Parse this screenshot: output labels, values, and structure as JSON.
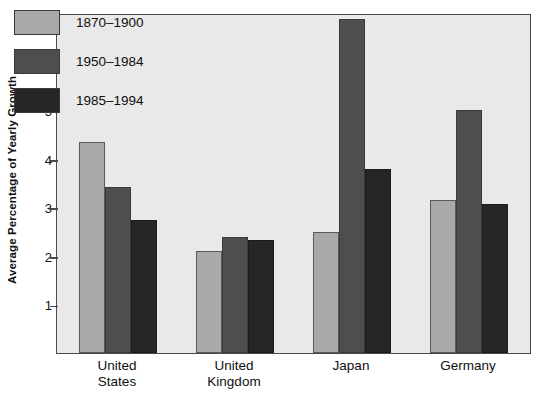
{
  "chart_data": {
    "type": "bar",
    "title": "",
    "xlabel": "",
    "ylabel": "Average Percentage of Yearly Growth",
    "ylim": [
      0,
      7
    ],
    "yticks": [
      1,
      2,
      3,
      4,
      5,
      6,
      7
    ],
    "ytick_labels": [
      "1",
      "2",
      "3",
      "4",
      "5",
      "6",
      "7"
    ],
    "grid": false,
    "legend_position": "top-left",
    "categories": [
      "United States",
      "United Kingdom",
      "Japan",
      "Germany"
    ],
    "category_labels": [
      "United\nStates",
      "United\nKingdom",
      "Japan",
      "Germany"
    ],
    "series": [
      {
        "name": "1870–1900",
        "color": "#a9a9a9",
        "values": [
          4.35,
          2.11,
          2.5,
          3.15
        ]
      },
      {
        "name": "1950–1984",
        "color": "#4e4e4e",
        "values": [
          3.42,
          2.38,
          6.88,
          5.0
        ]
      },
      {
        "name": "1985–1994",
        "color": "#262626",
        "values": [
          2.73,
          2.33,
          3.78,
          3.06
        ]
      }
    ]
  },
  "legend": {
    "items": [
      {
        "label": "1870–1900"
      },
      {
        "label": "1950–1984"
      },
      {
        "label": "1985–1994"
      }
    ]
  },
  "colors": {
    "series_1": "#a9a9a9",
    "series_2": "#4e4e4e",
    "series_3": "#262626",
    "plot_background": "#e9e9e9",
    "axis": "#4a4a4a",
    "page_background": "#ffffff"
  }
}
